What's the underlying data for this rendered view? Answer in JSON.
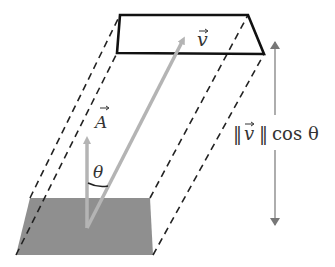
{
  "diagram": {
    "type": "flux-prism",
    "labels": {
      "velocity": "v",
      "area": "A",
      "angle": "θ",
      "height_expr_norm_open": "‖",
      "height_expr_var": "v",
      "height_expr_norm_close": "‖",
      "height_expr_tail": "cos θ"
    },
    "colors": {
      "outline": "#111111",
      "dashed": "#222222",
      "shaded_area": "#8f8f8f",
      "vector": "#b4b4b4",
      "dimension_arrow": "#777777",
      "text": "#333333"
    }
  }
}
